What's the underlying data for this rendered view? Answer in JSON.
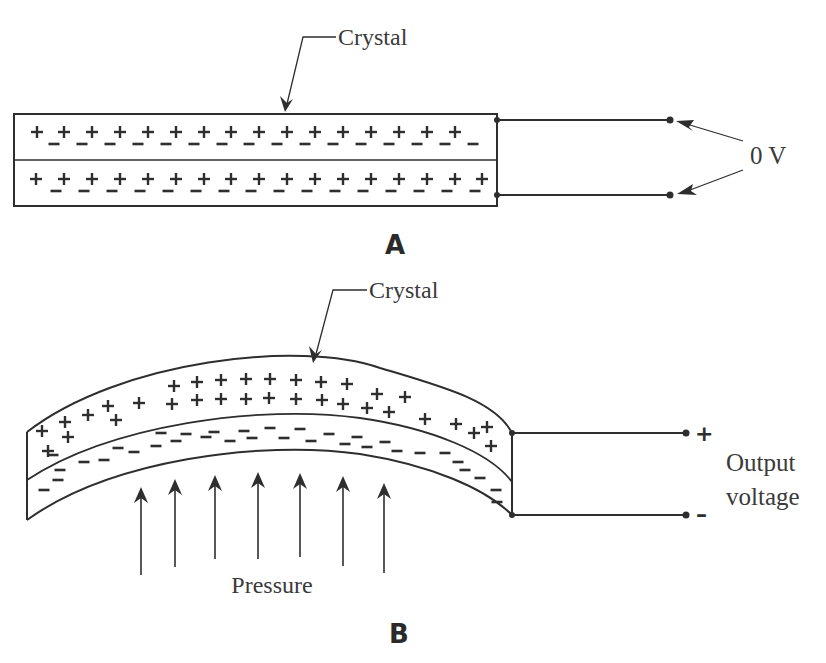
{
  "panel_a": {
    "label": "A",
    "crystal_label": "Crystal",
    "voltage_label": "0 V",
    "top_layer": {
      "plus": [
        31,
        58,
        86,
        114,
        142,
        170,
        198,
        225,
        253,
        281,
        309,
        337,
        365,
        393,
        421,
        449
      ],
      "minus": [
        48,
        76,
        104,
        132,
        160,
        188,
        216,
        243,
        271,
        299,
        327,
        355,
        383,
        411,
        439,
        467
      ]
    },
    "bottom_layer": {
      "plus": [
        30,
        58,
        86,
        114,
        142,
        170,
        198,
        225,
        253,
        281,
        309,
        337,
        365,
        393,
        421,
        449,
        476
      ],
      "minus": [
        50,
        78,
        106,
        134,
        162,
        190,
        218,
        245,
        273,
        301,
        329,
        357,
        385,
        413,
        441,
        469
      ]
    }
  },
  "panel_b": {
    "label": "B",
    "crystal_label": "Crystal",
    "pressure_label": "Pressure",
    "output_label_line1": "Output",
    "output_label_line2": "voltage",
    "positive_terminal": "+",
    "negative_terminal": "–",
    "plus_charges": [
      [
        174,
        386
      ],
      [
        197,
        382
      ],
      [
        221,
        380
      ],
      [
        246,
        379
      ],
      [
        270,
        379
      ],
      [
        296,
        380
      ],
      [
        321,
        382
      ],
      [
        347,
        384
      ],
      [
        172,
        404
      ],
      [
        197,
        400
      ],
      [
        221,
        399
      ],
      [
        246,
        399
      ],
      [
        269,
        398
      ],
      [
        296,
        399
      ],
      [
        322,
        400
      ],
      [
        343,
        404
      ],
      [
        367,
        408
      ],
      [
        377,
        394
      ],
      [
        405,
        397
      ],
      [
        389,
        412
      ],
      [
        425,
        419
      ],
      [
        139,
        403
      ],
      [
        108,
        406
      ],
      [
        88,
        415
      ],
      [
        116,
        420
      ],
      [
        42,
        431
      ],
      [
        65,
        422
      ],
      [
        68,
        437
      ],
      [
        48,
        451
      ],
      [
        456,
        424
      ],
      [
        474,
        433
      ],
      [
        487,
        427
      ],
      [
        491,
        446
      ]
    ],
    "minus_charges": [
      [
        53,
        455
      ],
      [
        60,
        470
      ],
      [
        44,
        490
      ],
      [
        58,
        480
      ],
      [
        84,
        462
      ],
      [
        104,
        460
      ],
      [
        118,
        448
      ],
      [
        134,
        452
      ],
      [
        156,
        446
      ],
      [
        161,
        433
      ],
      [
        176,
        441
      ],
      [
        186,
        434
      ],
      [
        206,
        437
      ],
      [
        214,
        432
      ],
      [
        230,
        441
      ],
      [
        244,
        431
      ],
      [
        252,
        438
      ],
      [
        270,
        428
      ],
      [
        284,
        438
      ],
      [
        300,
        429
      ],
      [
        311,
        441
      ],
      [
        329,
        434
      ],
      [
        345,
        444
      ],
      [
        357,
        437
      ],
      [
        367,
        447
      ],
      [
        385,
        442
      ],
      [
        397,
        451
      ],
      [
        420,
        453
      ],
      [
        445,
        453
      ],
      [
        458,
        462
      ],
      [
        465,
        470
      ],
      [
        480,
        478
      ],
      [
        496,
        490
      ],
      [
        497,
        502
      ]
    ],
    "pressure_arrows": [
      {
        "x": 141,
        "tip": 487,
        "base": 575
      },
      {
        "x": 175,
        "tip": 479,
        "base": 567
      },
      {
        "x": 215,
        "tip": 475,
        "base": 559
      },
      {
        "x": 258,
        "tip": 472,
        "base": 559
      },
      {
        "x": 300,
        "tip": 473,
        "base": 557
      },
      {
        "x": 343,
        "tip": 476,
        "base": 566
      },
      {
        "x": 384,
        "tip": 483,
        "base": 573
      }
    ]
  }
}
